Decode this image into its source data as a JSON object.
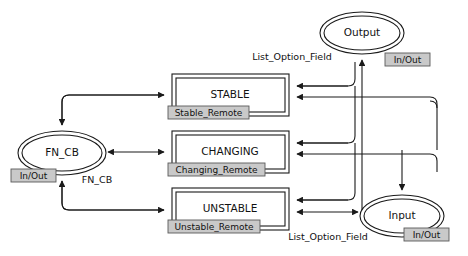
{
  "diagram": {
    "colors": {
      "stroke": "#1a1a1a",
      "node_fill": "#ffffff",
      "badge_fill": "#c9c9c9",
      "badge_border": "#5a5a5a",
      "background": "#ffffff"
    },
    "boxes": [
      {
        "id": "stable",
        "label": "STABLE",
        "badge": "Stable_Remote",
        "x": 172,
        "y": 74,
        "w": 117,
        "h": 42
      },
      {
        "id": "changing",
        "label": "CHANGING",
        "badge": "Changing_Remote",
        "x": 172,
        "y": 131,
        "w": 117,
        "h": 42
      },
      {
        "id": "unstable",
        "label": "UNSTABLE",
        "badge": "Unstable_Remote",
        "x": 172,
        "y": 188,
        "w": 117,
        "h": 42
      }
    ],
    "ellipses": [
      {
        "id": "fn_cb",
        "label": "FN_CB",
        "badge": "In/Out",
        "cx": 62,
        "cy": 153,
        "rx": 44,
        "ry": 22
      },
      {
        "id": "output",
        "label": "Output",
        "badge": "In/Out",
        "cx": 362,
        "cy": 33,
        "rx": 42,
        "ry": 21
      },
      {
        "id": "input",
        "label": "Input",
        "badge": "In/Out",
        "cx": 402,
        "cy": 216,
        "rx": 42,
        "ry": 21
      }
    ],
    "edge_labels": [
      {
        "id": "top-list-option",
        "text": "List_Option_Field",
        "x": 292,
        "y": 57
      },
      {
        "id": "fn-cb-edge",
        "text": "FN_CB",
        "x": 97,
        "y": 180
      },
      {
        "id": "bottom-list-option",
        "text": "List_Option_Field",
        "x": 328,
        "y": 237
      }
    ],
    "badges": {
      "in_out": "In/Out"
    }
  }
}
